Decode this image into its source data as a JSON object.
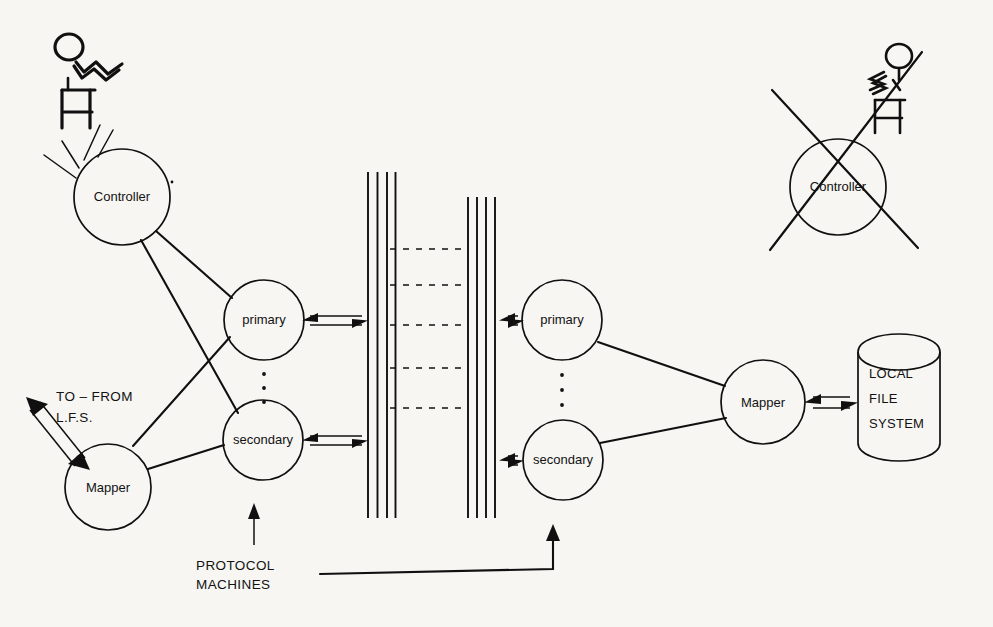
{
  "diagram": {
    "background_color": "#f7f6f3",
    "ink_color": "#101010"
  },
  "nodes": {
    "left_controller": {
      "label": "Controller",
      "cx": 122,
      "cy": 197,
      "r": 48
    },
    "left_primary": {
      "label": "primary",
      "cx": 264,
      "cy": 320,
      "r": 40
    },
    "left_secondary": {
      "label": "secondary",
      "cx": 263,
      "cy": 440,
      "r": 40
    },
    "left_mapper": {
      "label": "Mapper",
      "cx": 108,
      "cy": 487,
      "r": 43
    },
    "right_primary": {
      "label": "primary",
      "cx": 562,
      "cy": 320,
      "r": 40
    },
    "right_secondary": {
      "label": "secondary",
      "cx": 563,
      "cy": 460,
      "r": 40
    },
    "right_mapper": {
      "label": "Mapper",
      "cx": 763,
      "cy": 402,
      "r": 42
    },
    "crossed_controller": {
      "label": "Controller",
      "cx": 838,
      "cy": 187,
      "r": 48
    }
  },
  "storage": {
    "line1": "LOCAL",
    "line2": "FILE",
    "line3": "SYSTEM"
  },
  "labels": {
    "to_from_line1": "TO – FROM",
    "to_from_line2": "L.F.S.",
    "protocol_line1": "PROTOCOL",
    "protocol_line2": "MACHINES"
  },
  "network": {
    "left_bundle_x": [
      368,
      377.5,
      387,
      395.5
    ],
    "left_bundle_y": [
      172,
      518
    ],
    "right_bundle_x": [
      468,
      477,
      486,
      495
    ],
    "right_bundle_y": [
      197,
      518
    ],
    "connector_y": [
      249,
      285,
      325,
      368,
      408
    ],
    "connector_x": [
      390,
      468
    ]
  },
  "annotations": {
    "crossed_out": true,
    "vertical_ellipsis_count": 3
  }
}
